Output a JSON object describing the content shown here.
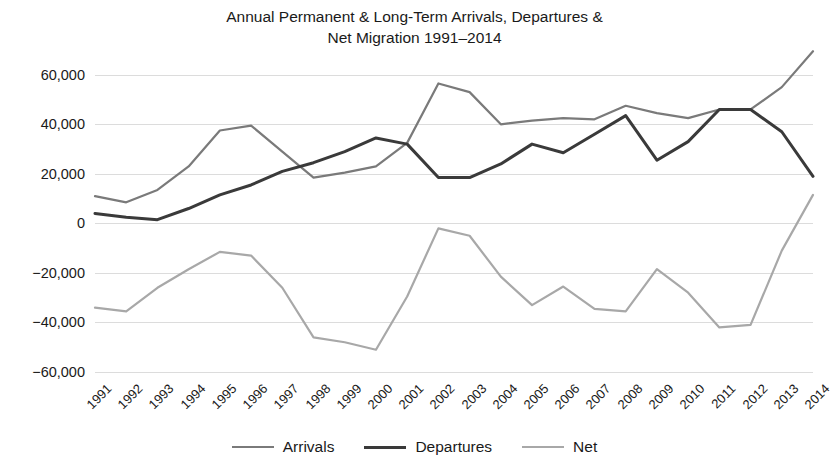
{
  "chart_data": {
    "type": "line",
    "title": "Annual Permanent & Long-Term Arrivals, Departures &\nNet Migration 1991–2014",
    "xlabel": "",
    "ylabel": "",
    "ylim": [
      -60000,
      70000
    ],
    "yticks": [
      60000,
      40000,
      20000,
      0,
      -20000,
      -40000,
      -60000
    ],
    "ytick_labels": [
      "60,000",
      "40,000",
      "20,000",
      "0",
      "−20,000",
      "−40,000",
      "−60,000"
    ],
    "grid": true,
    "legend_position": "bottom",
    "categories": [
      "1991",
      "1992",
      "1993",
      "1994",
      "1995",
      "1996",
      "1997",
      "1998",
      "1999",
      "2000",
      "2001",
      "2002",
      "2003",
      "2004",
      "2005",
      "2006",
      "2007",
      "2008",
      "2009",
      "2010",
      "2011",
      "2012",
      "2013",
      "2014"
    ],
    "series": [
      {
        "name": "Arrivals",
        "color": "#7a7a7a",
        "width": 2.2,
        "values": [
          11000,
          8500,
          13500,
          23000,
          37500,
          39500,
          29000,
          18500,
          20500,
          23000,
          32500,
          56500,
          53000,
          40000,
          41500,
          42500,
          42000,
          47500,
          44500,
          42500,
          46000,
          46000,
          55000,
          69500
        ]
      },
      {
        "name": "Departures",
        "color": "#3a3a3a",
        "width": 3.0,
        "values": [
          4000,
          2500,
          1500,
          6000,
          11500,
          15500,
          21000,
          24500,
          29000,
          34500,
          32000,
          18500,
          18500,
          24000,
          32000,
          28500,
          36000,
          43500,
          25500,
          33000,
          46000,
          46000,
          37000,
          19000
        ]
      },
      {
        "name": "Net",
        "color": "#a8a8a8",
        "width": 2.2,
        "values": [
          -34000,
          -35500,
          -26000,
          -18500,
          -11500,
          -13000,
          -26000,
          -46000,
          -48000,
          -51000,
          -29500,
          -2000,
          -5000,
          -21500,
          -33000,
          -25500,
          -34500,
          -35500,
          -18500,
          -28000,
          -42000,
          -41000,
          -11000,
          11500
        ]
      }
    ]
  },
  "legend": {
    "items": [
      {
        "label": "Arrivals",
        "color": "#7a7a7a",
        "width": 2.2
      },
      {
        "label": "Departures",
        "color": "#3a3a3a",
        "width": 3.0
      },
      {
        "label": "Net",
        "color": "#a8a8a8",
        "width": 2.2
      }
    ]
  }
}
